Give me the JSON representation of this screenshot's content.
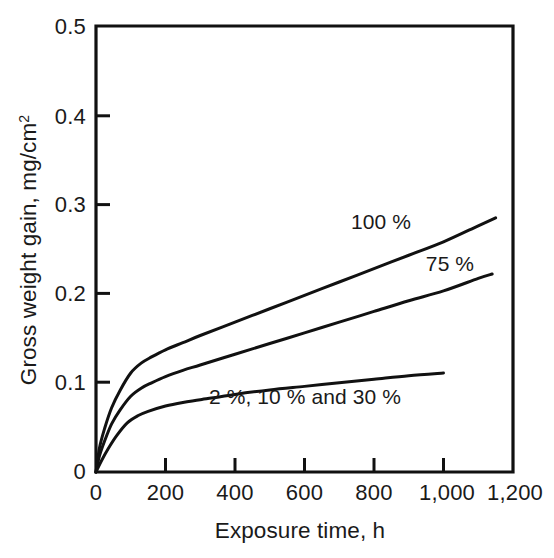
{
  "chart_data": {
    "type": "line",
    "title": "",
    "xlabel": "Exposure time, h",
    "ylabel": "Gross weight gain, mg/cm²",
    "xlim": [
      0,
      1200
    ],
    "ylim": [
      0,
      0.5
    ],
    "grid": false,
    "legend_position": "inline-annotations",
    "x_ticks": [
      0,
      200,
      400,
      600,
      800,
      1000,
      1200
    ],
    "x_tick_labels": [
      "0",
      "200",
      "400",
      "600",
      "800",
      "1,000",
      "1,200"
    ],
    "y_ticks": [
      0,
      0.1,
      0.2,
      0.3,
      0.4,
      0.5
    ],
    "y_tick_labels": [
      "0",
      "0.1",
      "0.2",
      "0.3",
      "0.4",
      "0.5"
    ],
    "series": [
      {
        "name": "100 %",
        "label": "100 %",
        "color": "#111111",
        "x": [
          0,
          10,
          25,
          45,
          70,
          100,
          130,
          160,
          200,
          250,
          300,
          400,
          500,
          600,
          700,
          800,
          900,
          1000,
          1100,
          1150
        ],
        "values": [
          0,
          0.027,
          0.049,
          0.072,
          0.092,
          0.111,
          0.122,
          0.129,
          0.137,
          0.145,
          0.153,
          0.168,
          0.183,
          0.198,
          0.213,
          0.228,
          0.243,
          0.258,
          0.276,
          0.285
        ]
      },
      {
        "name": "75 %",
        "label": "75 %",
        "color": "#111111",
        "x": [
          0,
          10,
          25,
          45,
          70,
          100,
          130,
          160,
          200,
          250,
          300,
          400,
          500,
          600,
          700,
          800,
          900,
          1000,
          1100,
          1140
        ],
        "values": [
          0,
          0.018,
          0.035,
          0.054,
          0.07,
          0.085,
          0.094,
          0.1,
          0.107,
          0.114,
          0.12,
          0.132,
          0.144,
          0.156,
          0.168,
          0.18,
          0.192,
          0.203,
          0.217,
          0.222
        ]
      },
      {
        "name": "2 %, 10 % and 30 %",
        "label": "2 %, 10 % and 30 %",
        "color": "#111111",
        "x": [
          0,
          15,
          35,
          60,
          90,
          120,
          150,
          200,
          250,
          300,
          400,
          500,
          600,
          700,
          800,
          900,
          1000
        ],
        "values": [
          0,
          0.012,
          0.026,
          0.041,
          0.055,
          0.063,
          0.068,
          0.074,
          0.078,
          0.081,
          0.087,
          0.092,
          0.096,
          0.1,
          0.104,
          0.108,
          0.111
        ]
      }
    ],
    "annotations": [
      {
        "text": "100 %",
        "x": 820,
        "y": 0.295
      },
      {
        "text": "75 %",
        "x": 1020,
        "y": 0.248
      },
      {
        "text": "2 %, 10 % and 30 %",
        "x": 600,
        "y": 0.072
      }
    ]
  },
  "axes": {
    "y_title": "Gross weight gain, mg/cm",
    "y_title_sup": "2",
    "x_title": "Exposure time, h",
    "y_tick_0": "0",
    "y_tick_1": "0.1",
    "y_tick_2": "0.2",
    "y_tick_3": "0.3",
    "y_tick_4": "0.4",
    "y_tick_5": "0.5",
    "x_tick_0": "0",
    "x_tick_1": "200",
    "x_tick_2": "400",
    "x_tick_3": "600",
    "x_tick_4": "800",
    "x_tick_5": "1,000",
    "x_tick_6": "1,200"
  },
  "labels": {
    "series_100": "100 %",
    "series_75": "75 %",
    "series_low": "2 %, 10 % and 30 %"
  },
  "colors": {
    "ink": "#111111",
    "background": "#ffffff"
  }
}
